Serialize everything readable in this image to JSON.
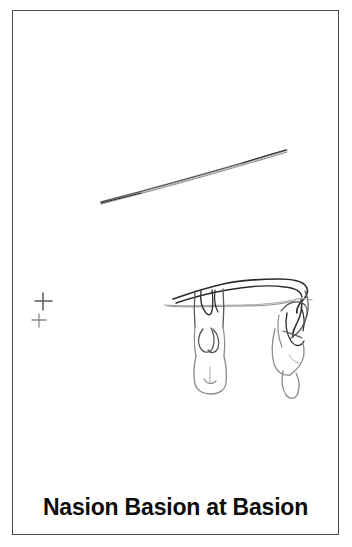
{
  "figure": {
    "caption": "Nasion Basion at Basion",
    "border_color": "#4a4a4a",
    "background_color": "#ffffff",
    "ink_color": "#2b2b2b",
    "faint_ink_color": "#a8a8a8"
  },
  "drawing": {
    "title": "Nasion Basion at Basion",
    "elements": [
      {
        "name": "needle-line",
        "description": "long thin diagonal needle shaft",
        "from": [
          100,
          200
        ],
        "to": [
          285,
          148
        ]
      },
      {
        "name": "upper-cross-marker",
        "description": "larger registration plus mark",
        "center": [
          30,
          290
        ],
        "size": 17
      },
      {
        "name": "lower-cross-marker",
        "description": "smaller registration plus mark",
        "center": [
          26,
          309
        ],
        "size": 12
      },
      {
        "name": "basion-outline-curve",
        "description": "dark cranial base outline curve"
      },
      {
        "name": "palate-horizontal-line",
        "description": "faint horizontal occlusal reference line"
      },
      {
        "name": "left-tooth-outline",
        "description": "left incisor crown and root outline"
      },
      {
        "name": "right-tooth-outline",
        "description": "right incisor crown and root outline"
      }
    ]
  }
}
